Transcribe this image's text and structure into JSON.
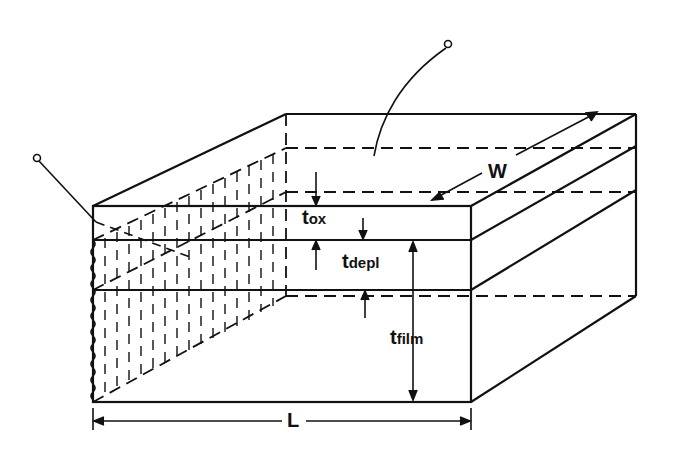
{
  "diagram": {
    "labels": {
      "t_ox": {
        "main": "t",
        "sub": "ox"
      },
      "t_depl": {
        "main": "t",
        "sub": "depl"
      },
      "t_film": {
        "main": "t",
        "sub": "film"
      },
      "W": "W",
      "L": "L"
    },
    "colors": {
      "ink": "#111111",
      "background": "#ffffff"
    }
  }
}
